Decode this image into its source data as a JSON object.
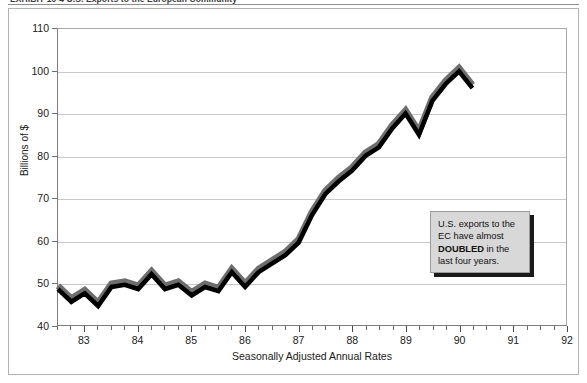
{
  "exhibit": {
    "title": "EXHIBIT 10-4  U.S. Exports to the European Community"
  },
  "annotation": {
    "line1": "U.S. exports to the",
    "line2": "EC have almost",
    "bold": "DOUBLED",
    "line3": " in the",
    "line4": "last four years."
  },
  "colors": {
    "line_main": "#000000",
    "line_shadow": "#6e6e6e",
    "gridline": "#c9c9c9",
    "axis": "#7d7d7d",
    "callout_bg": "#d8d8d8",
    "callout_shadow": "#1a1a1a"
  },
  "chart_data": {
    "type": "line",
    "title": "EXHIBIT 10-4  U.S. Exports to the European Community",
    "xlabel": "Seasonally Adjusted Annual Rates",
    "ylabel": "Billions of $",
    "xlim": [
      82.5,
      92.0
    ],
    "ylim": [
      40,
      110
    ],
    "yticks": [
      40,
      50,
      60,
      70,
      80,
      90,
      100,
      110
    ],
    "xticks": [
      83,
      84,
      85,
      86,
      87,
      88,
      89,
      90,
      91,
      92
    ],
    "xtick_labels": [
      "83",
      "84",
      "85",
      "86",
      "87",
      "88",
      "89",
      "90",
      "91",
      "92"
    ],
    "grid": true,
    "legend": null,
    "minor_tick_interval": 0.25,
    "series": [
      {
        "name": "U.S. exports to the EC",
        "x": [
          82.5,
          82.75,
          83.0,
          83.25,
          83.5,
          83.75,
          84.0,
          84.25,
          84.5,
          84.75,
          85.0,
          85.25,
          85.5,
          85.75,
          86.0,
          86.25,
          86.5,
          86.75,
          87.0,
          87.25,
          87.5,
          87.75,
          88.0,
          88.25,
          88.5,
          88.75,
          89.0,
          89.25,
          89.5,
          89.75,
          90.0,
          90.25
        ],
        "values": [
          48.5,
          45.5,
          47.5,
          44.5,
          49.0,
          49.5,
          48.5,
          52.0,
          48.5,
          49.5,
          47.0,
          49.0,
          48.0,
          52.5,
          49.0,
          52.5,
          54.5,
          56.5,
          59.5,
          66.0,
          71.0,
          74.0,
          76.5,
          80.0,
          82.0,
          86.5,
          90.0,
          85.0,
          93.0,
          97.0,
          100.0,
          96.0
        ]
      }
    ]
  }
}
